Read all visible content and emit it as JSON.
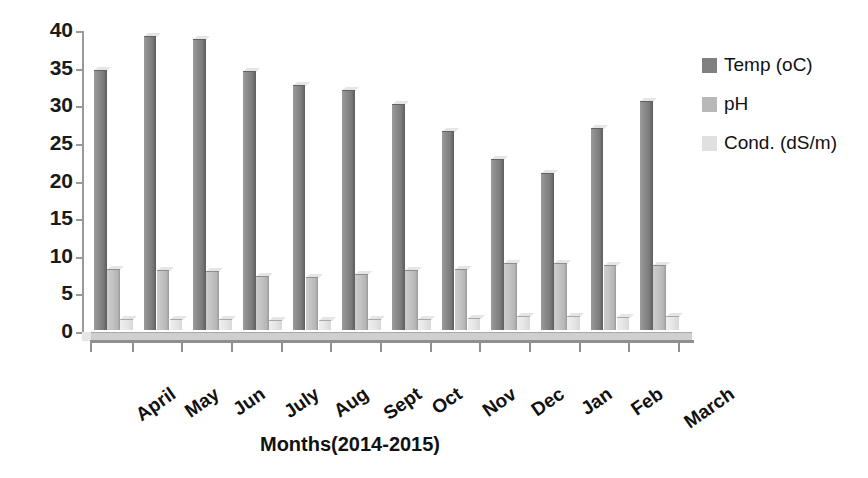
{
  "chart_data": {
    "type": "bar",
    "title": "",
    "xlabel": "Months(2014-2015)",
    "ylabel": "Measurd Values",
    "ylim": [
      0,
      40
    ],
    "yticks": [
      0,
      5,
      10,
      15,
      20,
      25,
      30,
      35,
      40
    ],
    "grid": false,
    "legend_position": "right",
    "categories": [
      "April",
      "May",
      "Jun",
      "July",
      "Aug",
      "Sept",
      "Oct",
      "Nov",
      "Dec",
      "Jan",
      "Feb",
      "March"
    ],
    "series": [
      {
        "name": "Temp (oC)",
        "color": "#808080",
        "values": [
          34.5,
          39.1,
          38.7,
          34.4,
          32.6,
          31.9,
          30.1,
          26.4,
          22.7,
          20.9,
          26.8,
          30.4
        ]
      },
      {
        "name": "pH",
        "color": "#b8b8b8",
        "values": [
          8.1,
          8.0,
          7.8,
          7.2,
          7.1,
          7.4,
          8.0,
          8.1,
          8.9,
          8.9,
          8.7,
          8.6
        ]
      },
      {
        "name": "Cond. (dS/m)",
        "color": "#e0e0e0",
        "values": [
          1.5,
          1.5,
          1.4,
          1.3,
          1.3,
          1.4,
          1.5,
          1.6,
          1.9,
          1.8,
          1.7,
          1.8
        ]
      }
    ]
  },
  "legend": {
    "items": [
      {
        "label": "Temp (oC)",
        "color": "#808080"
      },
      {
        "label": "pH",
        "color": "#b8b8b8"
      },
      {
        "label": "Cond. (dS/m)",
        "color": "#e0e0e0"
      }
    ]
  },
  "axes": {
    "y_title": "Measurd Values",
    "x_title": "Months(2014-2015)"
  }
}
